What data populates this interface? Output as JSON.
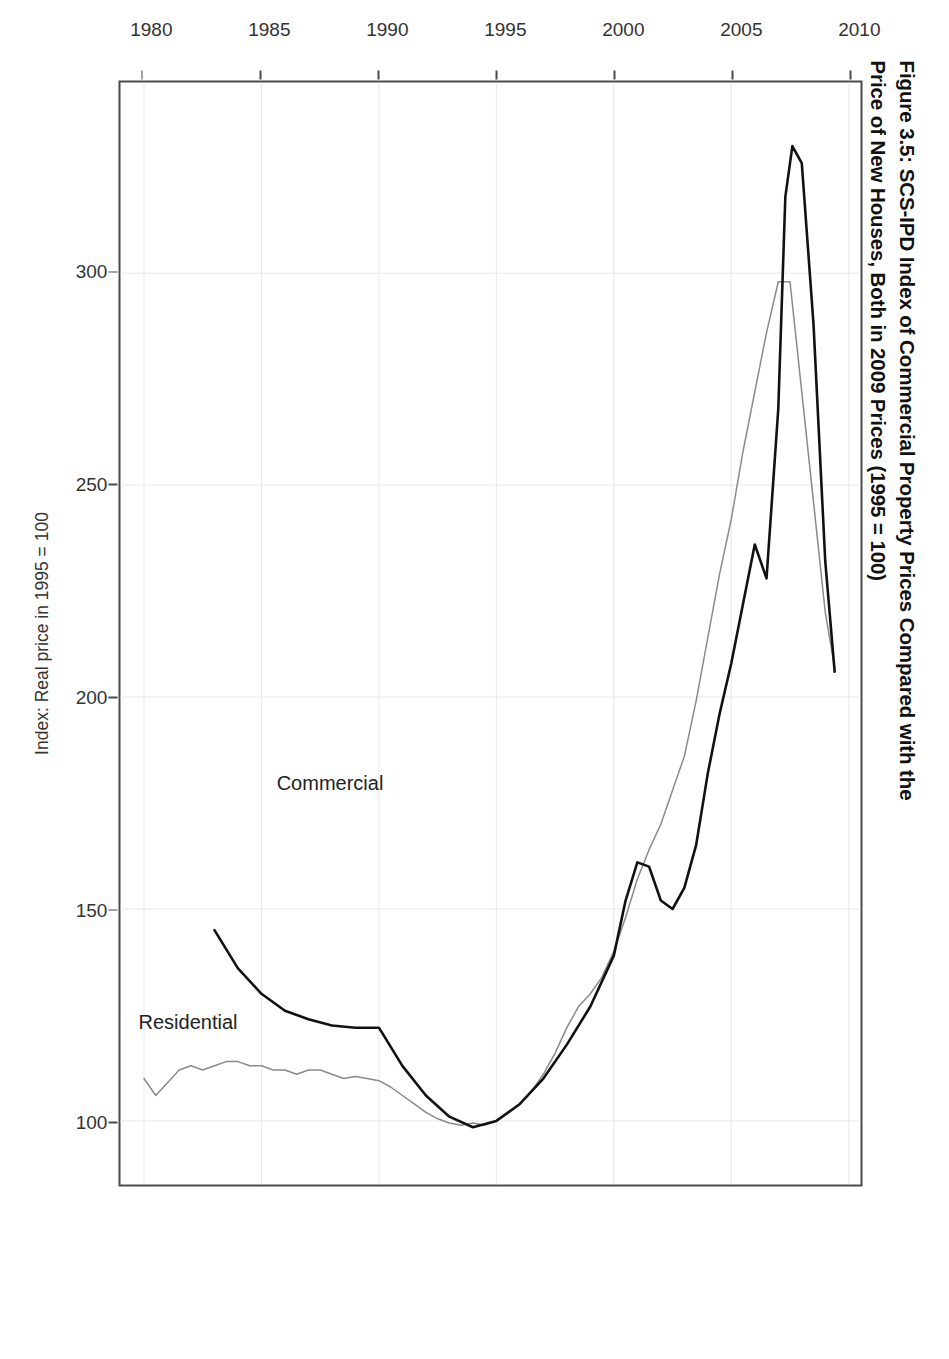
{
  "figure": {
    "title_line1": "Figure 3.5: SCS-IPD Index of Commercial Property Prices Compared with the",
    "title_line2": "Price of New Houses, Both in 2009 Prices (1995 = 100)",
    "rotation": "90deg-clockwise"
  },
  "chart_data": {
    "type": "line",
    "title": "Figure 3.5: SCS-IPD Index of Commercial Property Prices Compared with the Price of New Houses, Both in 2009 Prices (1995 = 100)",
    "xlabel": "",
    "ylabel": "Index: Real price in 1995 = 100",
    "xlim": [
      1979,
      2010.5
    ],
    "ylim": [
      85,
      345
    ],
    "xticks": [
      1980,
      1985,
      1990,
      1995,
      2000,
      2005,
      2010
    ],
    "xtick_labels": [
      "1980",
      "1985",
      "1990",
      "1995",
      "2000",
      "2005",
      "2010"
    ],
    "yticks": [
      100,
      150,
      200,
      250,
      300
    ],
    "ytick_labels": [
      "100",
      "150",
      "200",
      "250",
      "300"
    ],
    "grid": true,
    "legend_position": "inline-annotations",
    "series": [
      {
        "name": "Commercial",
        "color": "#111111",
        "label_x": 1988.0,
        "label_y": 180,
        "x": [
          1983.0,
          1984.0,
          1985.0,
          1986.0,
          1987.0,
          1988.0,
          1989.0,
          1990.0,
          1991.0,
          1992.0,
          1993.0,
          1994.0,
          1995.0,
          1996.0,
          1997.0,
          1998.0,
          1999.0,
          2000.0,
          2000.5,
          2001.0,
          2001.5,
          2002.0,
          2002.5,
          2003.0,
          2003.5,
          2004.0,
          2004.5,
          2005.0,
          2005.5,
          2006.0,
          2006.5,
          2007.0,
          2007.3,
          2007.6,
          2008.0,
          2008.5,
          2009.0,
          2009.4
        ],
        "y": [
          145,
          136,
          130,
          126,
          124,
          122.5,
          122,
          122,
          113,
          106,
          101,
          98.5,
          100,
          104,
          110,
          118,
          127,
          139,
          152,
          161,
          160,
          152,
          150,
          155,
          165,
          182,
          196,
          208,
          222,
          236,
          228,
          268,
          318,
          330,
          326,
          288,
          232,
          206
        ]
      },
      {
        "name": "Residential",
        "color": "#8a8a8a",
        "label_x": 1982.0,
        "label_y": 122,
        "x": [
          1980.0,
          1980.5,
          1981.0,
          1981.5,
          1982.0,
          1982.5,
          1983.0,
          1983.5,
          1984.0,
          1984.5,
          1985.0,
          1985.5,
          1986.0,
          1986.5,
          1987.0,
          1987.5,
          1988.0,
          1988.5,
          1989.0,
          1989.5,
          1990.0,
          1990.5,
          1991.0,
          1991.5,
          1992.0,
          1992.5,
          1993.0,
          1993.5,
          1994.0,
          1994.5,
          1995.0,
          1995.5,
          1996.0,
          1996.5,
          1997.0,
          1997.5,
          1998.0,
          1998.5,
          1999.0,
          1999.5,
          2000.0,
          2000.5,
          2001.0,
          2001.5,
          2002.0,
          2002.5,
          2003.0,
          2003.5,
          2004.0,
          2004.5,
          2005.0,
          2005.5,
          2006.0,
          2006.5,
          2007.0,
          2007.5,
          2008.0,
          2008.5,
          2009.0,
          2009.4
        ],
        "y": [
          110,
          106,
          109,
          112,
          113,
          112,
          113,
          114,
          114,
          113,
          113,
          112,
          112,
          111,
          112,
          112,
          111,
          110,
          110.5,
          110,
          109.5,
          108,
          106,
          104,
          102,
          100.5,
          99.5,
          99,
          99.5,
          99,
          100,
          102,
          104,
          107,
          111,
          116,
          122,
          127,
          130,
          134,
          140,
          148,
          157,
          164,
          170,
          178,
          186,
          199,
          214,
          229,
          242,
          258,
          272,
          286,
          298,
          298,
          272,
          246,
          220,
          207
        ]
      }
    ]
  },
  "axes": {
    "x_tick_labels": [
      "1980",
      "1985",
      "1990",
      "1995",
      "2000",
      "2005",
      "2010"
    ],
    "y_tick_labels": [
      "100",
      "150",
      "200",
      "250",
      "300"
    ],
    "y_axis_title": "Index: Real price in 1995 = 100"
  },
  "series_labels": {
    "commercial": "Commercial",
    "residential": "Residential"
  }
}
